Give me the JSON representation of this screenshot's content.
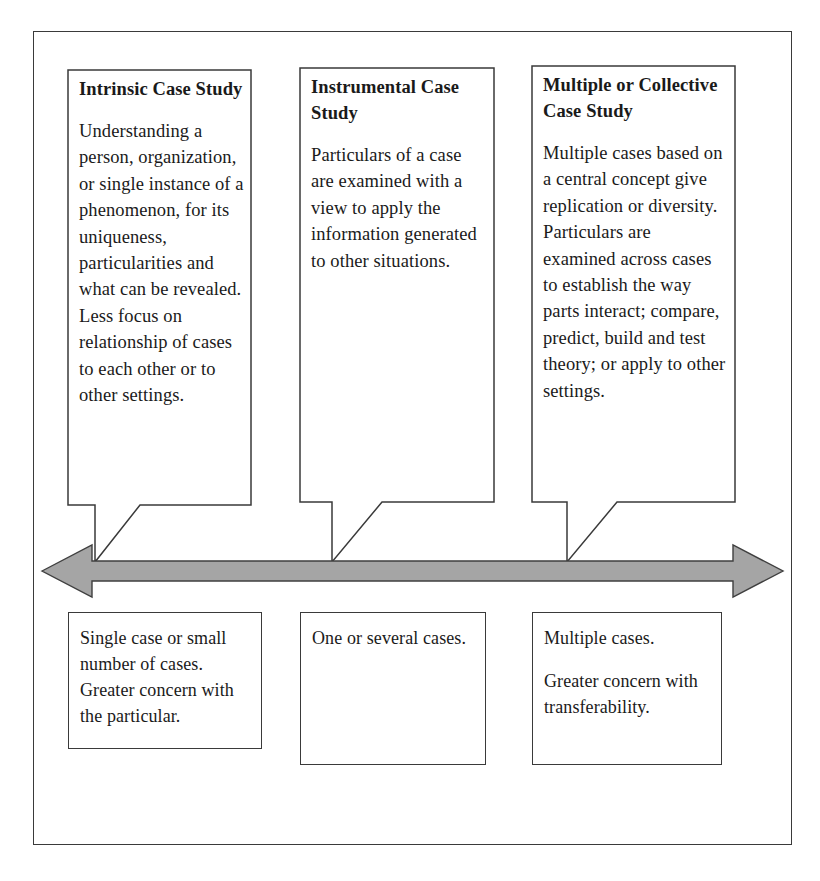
{
  "diagram": {
    "continuum_arrow": {
      "name": "double-headed-continuum-arrow",
      "direction": "bidirectional",
      "fill_color": "#a5a5a5",
      "stroke_color": "#3f3f3f"
    },
    "frame_color": "#3a3a3a",
    "callouts": [
      {
        "id": "intrinsic",
        "title": "Intrinsic Case Study",
        "body": "Understanding a person, organization, or single instance of a phenomenon, for its uniqueness, particularities and what can be revealed. Less focus on relationship of cases to each other or to other settings."
      },
      {
        "id": "instrumental",
        "title": "Instrumental Case Study",
        "body": "Particulars of a case are examined with a view to apply the information generated to other situations."
      },
      {
        "id": "collective",
        "title": "Multiple or Collective Case Study",
        "body": "Multiple cases based on a central concept give replication or diversity. Particulars are examined across cases to establish the way parts interact; compare, predict, build and test theory; or apply to other settings."
      }
    ],
    "descriptors": [
      {
        "id": "intrinsic-descriptor",
        "paragraphs": [
          "Single case or small number of cases. Greater concern with the particular."
        ]
      },
      {
        "id": "instrumental-descriptor",
        "paragraphs": [
          "One or several cases."
        ]
      },
      {
        "id": "collective-descriptor",
        "paragraphs": [
          "Multiple cases.",
          "Greater concern with transferability."
        ]
      }
    ]
  }
}
